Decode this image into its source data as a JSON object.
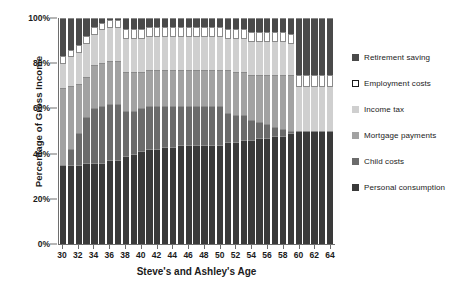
{
  "chart_data": {
    "type": "bar",
    "subtype": "stacked-percentage",
    "title": "",
    "xlabel": "Steve's and Ashley's Age",
    "ylabel": "Percentage of Gross Income",
    "ylim": [
      0,
      100
    ],
    "ytick_labels": [
      "0%",
      "20%",
      "40%",
      "60%",
      "80%",
      "100%"
    ],
    "ytick_values": [
      0,
      20,
      40,
      60,
      80,
      100
    ],
    "grid": false,
    "legend_position": "right",
    "categories": [
      30,
      31,
      32,
      33,
      34,
      35,
      36,
      37,
      38,
      39,
      40,
      41,
      42,
      43,
      44,
      45,
      46,
      47,
      48,
      49,
      50,
      51,
      52,
      53,
      54,
      55,
      56,
      57,
      58,
      59,
      60,
      61,
      62,
      63,
      64
    ],
    "xtick_labels": [
      "30",
      "32",
      "34",
      "36",
      "38",
      "40",
      "42",
      "44",
      "46",
      "48",
      "50",
      "52",
      "54",
      "56",
      "58",
      "60",
      "62",
      "64"
    ],
    "xtick_values": [
      30,
      32,
      34,
      36,
      38,
      40,
      42,
      44,
      46,
      48,
      50,
      52,
      54,
      56,
      58,
      60,
      62,
      64
    ],
    "series": [
      {
        "name": "Personal consumption",
        "color": "#3a3a3a",
        "values": [
          35,
          35,
          35,
          36,
          36,
          36,
          37,
          37,
          39,
          40,
          41,
          42,
          42,
          43,
          43,
          44,
          44,
          44,
          44,
          44,
          44,
          45,
          45,
          46,
          46,
          47,
          47,
          48,
          48,
          49,
          50,
          50,
          50,
          50,
          50
        ]
      },
      {
        "name": "Child costs",
        "color": "#6b6b6b",
        "values": [
          0,
          7,
          14,
          20,
          24,
          25,
          25,
          25,
          20,
          19,
          19,
          19,
          19,
          18,
          18,
          17,
          17,
          17,
          17,
          17,
          17,
          13,
          12,
          11,
          9,
          7,
          6,
          4,
          3,
          1,
          0,
          0,
          0,
          0,
          0
        ]
      },
      {
        "name": "Mortgage payments",
        "color": "#a2a2a2",
        "values": [
          34,
          28,
          22,
          18,
          19,
          19,
          19,
          19,
          17,
          17,
          16,
          16,
          16,
          16,
          16,
          16,
          16,
          16,
          16,
          16,
          16,
          19,
          19,
          19,
          20,
          21,
          22,
          23,
          24,
          25,
          0,
          0,
          0,
          0,
          0
        ]
      },
      {
        "name": "Income tax",
        "color": "#cfcfcf",
        "values": [
          11,
          13,
          14,
          15,
          14,
          15,
          15,
          15,
          15,
          15,
          15,
          15,
          15,
          15,
          15,
          15,
          15,
          15,
          15,
          15,
          15,
          14,
          15,
          15,
          15,
          15,
          15,
          15,
          15,
          14,
          20,
          20,
          20,
          20,
          20
        ]
      },
      {
        "name": "Employment costs",
        "color": "#ffffff",
        "values": [
          3,
          3,
          3,
          3,
          3,
          3,
          3,
          3,
          4,
          4,
          4,
          4,
          4,
          4,
          4,
          4,
          4,
          4,
          4,
          4,
          4,
          4,
          4,
          4,
          4,
          4,
          4,
          4,
          4,
          4,
          5,
          5,
          5,
          5,
          5
        ]
      },
      {
        "name": "Retirement saving",
        "color": "#4a4a4a",
        "values": [
          17,
          14,
          12,
          8,
          4,
          2,
          1,
          1,
          5,
          5,
          5,
          4,
          4,
          4,
          4,
          4,
          4,
          4,
          4,
          4,
          4,
          5,
          5,
          5,
          6,
          6,
          6,
          6,
          6,
          7,
          25,
          25,
          25,
          25,
          25
        ]
      }
    ]
  },
  "legend": {
    "items": [
      {
        "label": "Retirement saving",
        "series_index": 5
      },
      {
        "label": "Employment costs",
        "series_index": 4
      },
      {
        "label": "Income tax",
        "series_index": 3
      },
      {
        "label": "Mortgage payments",
        "series_index": 2
      },
      {
        "label": "Child costs",
        "series_index": 1
      },
      {
        "label": "Personal consumption",
        "series_index": 0
      }
    ]
  },
  "colors": {
    "axis": "#6e6e6e",
    "text": "#1b1b1b",
    "background": "#ffffff",
    "bar_outline": "#8a8a8a"
  }
}
